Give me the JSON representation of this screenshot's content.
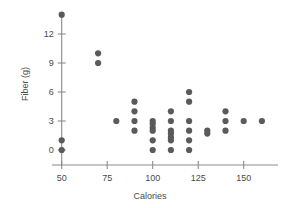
{
  "chart_data": {
    "type": "scatter",
    "title": "",
    "xlabel": "Calories",
    "ylabel": "Fiber (g)",
    "xlim": [
      40,
      172
    ],
    "ylim": [
      -1.2,
      15.3
    ],
    "grid": false,
    "legend": null,
    "xticks": [
      50,
      75,
      100,
      125,
      150
    ],
    "xtick_labels": [
      "50",
      "75",
      "100",
      "125",
      "150"
    ],
    "yticks": [
      0,
      3,
      6,
      9,
      12
    ],
    "ytick_labels": [
      "0",
      "3",
      "6",
      "9",
      "12"
    ],
    "marker": "filled-circle",
    "marker_color": "#5a5a5a",
    "marker_size": 3.1,
    "point_count": 36,
    "points": [
      {
        "x": 50,
        "y": 14
      },
      {
        "x": 50,
        "y": 1
      },
      {
        "x": 50,
        "y": 0
      },
      {
        "x": 70,
        "y": 10
      },
      {
        "x": 70,
        "y": 9
      },
      {
        "x": 80,
        "y": 3
      },
      {
        "x": 90,
        "y": 5
      },
      {
        "x": 90,
        "y": 4
      },
      {
        "x": 90,
        "y": 3
      },
      {
        "x": 90,
        "y": 2
      },
      {
        "x": 100,
        "y": 3
      },
      {
        "x": 100,
        "y": 2.7
      },
      {
        "x": 100,
        "y": 2.3
      },
      {
        "x": 100,
        "y": 2
      },
      {
        "x": 100,
        "y": 1
      },
      {
        "x": 100,
        "y": 0
      },
      {
        "x": 110,
        "y": 4
      },
      {
        "x": 110,
        "y": 3
      },
      {
        "x": 110,
        "y": 2
      },
      {
        "x": 110,
        "y": 1.7
      },
      {
        "x": 110,
        "y": 1.3
      },
      {
        "x": 110,
        "y": 1
      },
      {
        "x": 110,
        "y": 0
      },
      {
        "x": 120,
        "y": 6
      },
      {
        "x": 120,
        "y": 5
      },
      {
        "x": 120,
        "y": 3
      },
      {
        "x": 120,
        "y": 2
      },
      {
        "x": 120,
        "y": 1
      },
      {
        "x": 120,
        "y": 0
      },
      {
        "x": 130,
        "y": 2
      },
      {
        "x": 130,
        "y": 1.7
      },
      {
        "x": 140,
        "y": 4
      },
      {
        "x": 140,
        "y": 3
      },
      {
        "x": 140,
        "y": 2
      },
      {
        "x": 150,
        "y": 3
      },
      {
        "x": 160,
        "y": 3
      }
    ]
  },
  "axes": {
    "x_axis_name": "x-axis",
    "y_axis_name": "y-axis"
  },
  "colors": {
    "marker": "#5a5a5a",
    "axis": "#8c8c8c",
    "text": "#4a4a4a",
    "background": "#ffffff"
  }
}
